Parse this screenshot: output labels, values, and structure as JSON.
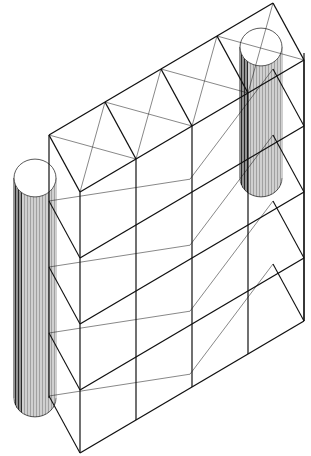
{
  "figure": {
    "line_color": "#111111",
    "background": "#ffffff",
    "levels": 5,
    "bays": 4,
    "cylinders": 2
  }
}
